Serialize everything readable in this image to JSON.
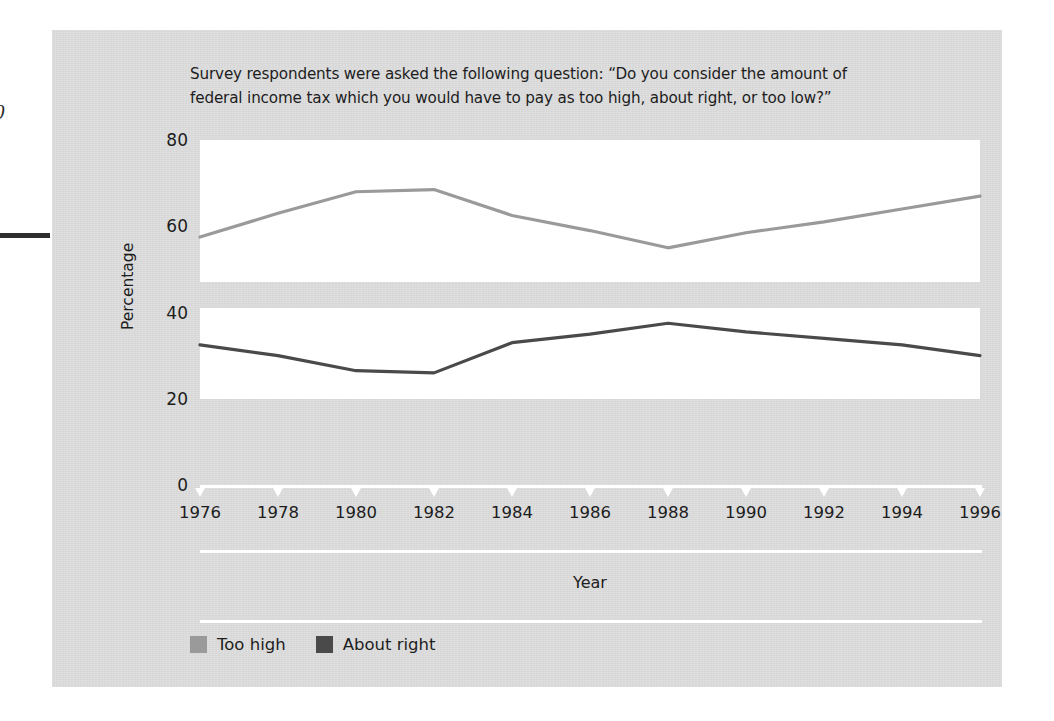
{
  "margin": {
    "folio_fragment": "0"
  },
  "figure": {
    "question": "Survey respondents were asked the following question: “Do you consider the amount of federal income tax which you would have to pay as too high, about right, or too low?”"
  },
  "legend": {
    "items": [
      {
        "label": "Too high",
        "color": "#9a9a9a",
        "swatch_name": "legend-swatch-too-high"
      },
      {
        "label": "About right",
        "color": "#4a4a4a",
        "swatch_name": "legend-swatch-about-right"
      }
    ]
  },
  "chart_data": {
    "type": "line",
    "title": "",
    "xlabel": "Year",
    "ylabel": "Percentage",
    "xlim": [
      1976,
      1996
    ],
    "ylim": [
      0,
      80
    ],
    "grid": false,
    "legend_position": "bottom-left",
    "x_tick_labels": [
      "1976",
      "1978",
      "1980",
      "1982",
      "1984",
      "1986",
      "1988",
      "1990",
      "1992",
      "1994",
      "1996"
    ],
    "y_tick_labels": [
      "0",
      "20",
      "40",
      "60",
      "80"
    ],
    "y_ticks": [
      0,
      20,
      40,
      60,
      80
    ],
    "x": [
      1976,
      1978,
      1980,
      1982,
      1984,
      1986,
      1988,
      1990,
      1992,
      1994,
      1996
    ],
    "series": [
      {
        "name": "Too high",
        "color": "#9a9a9a",
        "values": [
          57.5,
          63,
          68,
          68.5,
          62.5,
          59,
          55,
          58.5,
          61,
          64,
          67
        ]
      },
      {
        "name": "About right",
        "color": "#4a4a4a",
        "values": [
          32.5,
          30,
          26.5,
          26,
          33,
          35,
          37.5,
          35.5,
          34,
          32.5,
          30
        ]
      }
    ],
    "highlight_bands": [
      {
        "name": "upper-band",
        "from": 47,
        "to": 80
      },
      {
        "name": "lower-band",
        "from": 20,
        "to": 41
      }
    ]
  }
}
